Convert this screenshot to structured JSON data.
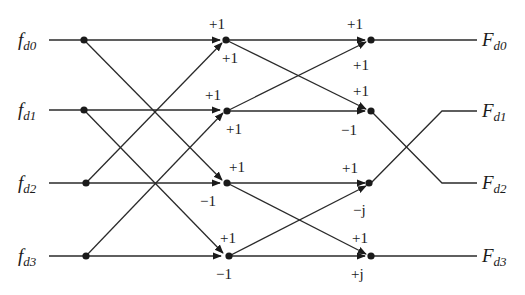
{
  "diagram": {
    "type": "4-point FFT butterfly signal flow graph (decimation in frequency)",
    "inputs": [
      {
        "main": "f",
        "sub": "d0"
      },
      {
        "main": "f",
        "sub": "d1"
      },
      {
        "main": "f",
        "sub": "d2"
      },
      {
        "main": "f",
        "sub": "d3"
      }
    ],
    "outputs": [
      {
        "main": "F",
        "sub": "d0"
      },
      {
        "main": "F",
        "sub": "d1"
      },
      {
        "main": "F",
        "sub": "d2"
      },
      {
        "main": "F",
        "sub": "d3"
      }
    ],
    "stage1_coefficients": [
      {
        "row": 0,
        "above": "+1",
        "below": "+1"
      },
      {
        "row": 1,
        "above": "+1",
        "below": "+1"
      },
      {
        "row": 2,
        "above": "+1",
        "below": "−1"
      },
      {
        "row": 3,
        "above": "+1",
        "below": "−1"
      }
    ],
    "stage2_coefficients": [
      {
        "row": 0,
        "above": "+1",
        "below": "+1"
      },
      {
        "row": 1,
        "above": "+1",
        "below": "−1"
      },
      {
        "row": 2,
        "above": "+1",
        "below": "−j"
      },
      {
        "row": 3,
        "above": "+1",
        "below": "+j"
      }
    ],
    "output_order_note": "outputs of rows 1 and 2 are swapped (bit reversal)"
  }
}
